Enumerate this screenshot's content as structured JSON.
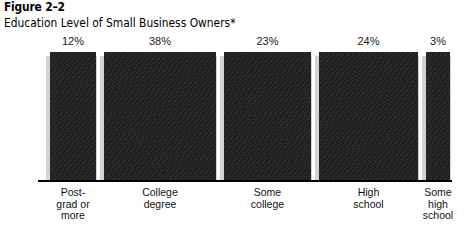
{
  "figure": {
    "number": "Figure 2–2",
    "subtitle": "Education Level of Small Business Owners*"
  },
  "chart_data": {
    "type": "bar",
    "orientation": "width-encoded",
    "title": "Education Level of Small Business Owners*",
    "figure_number": "Figure 2–2",
    "xlabel": "",
    "ylabel": "",
    "grid": false,
    "legend": false,
    "note": "All bars share an identical top and baseline; each bar's WIDTH encodes its percentage of the whole (values sum to 100%).",
    "categories": [
      "Post-\ngrad or\nmore",
      "College\ndegree",
      "Some\ncollege",
      "High\nschool",
      "Some\nhigh\nschool"
    ],
    "values": [
      12,
      38,
      23,
      24,
      3
    ],
    "value_labels": [
      "12%",
      "38%",
      "23%",
      "24%",
      "3%"
    ],
    "total": 100,
    "colors": {
      "bar_fill": "#1e1e1e",
      "bar_shadow": "#d2d2d2",
      "baseline": "#000000",
      "text": "#000000",
      "background": "#ffffff"
    },
    "geometry": {
      "bars": [
        {
          "left": 50,
          "width": 46,
          "shadow_left": 46,
          "shadow_width": 5
        },
        {
          "left": 104,
          "width": 112,
          "shadow_left": 100,
          "shadow_width": 5
        },
        {
          "left": 224,
          "width": 87,
          "shadow_left": 220,
          "shadow_width": 5
        },
        {
          "left": 319,
          "width": 99,
          "shadow_left": 315,
          "shadow_width": 5
        },
        {
          "left": 426,
          "width": 24,
          "shadow_left": 422,
          "shadow_width": 5
        }
      ]
    }
  }
}
